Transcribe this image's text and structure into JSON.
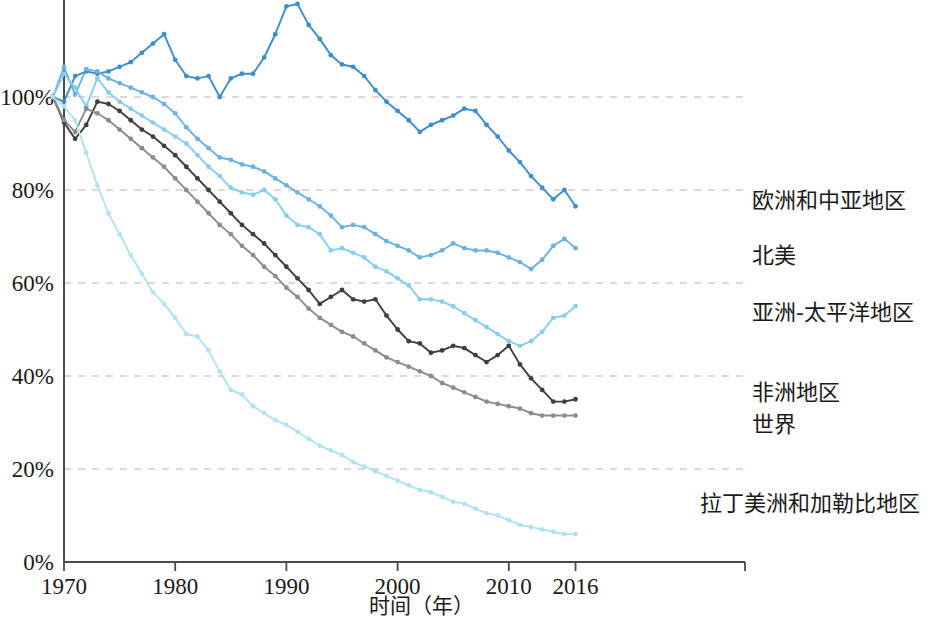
{
  "chart_data": {
    "type": "line",
    "title": "",
    "xlabel": "时间（年）",
    "ylabel": "",
    "xlim": [
      1968,
      2017
    ],
    "ylim": [
      0,
      125
    ],
    "grid": true,
    "grid_axis": "y",
    "legend_position": "right-inline-labels",
    "x_ticks": [
      1970,
      1980,
      1990,
      2000,
      2010,
      2016
    ],
    "x_tick_labels": [
      "1970",
      "1980",
      "1990",
      "2000",
      "2010",
      "2016"
    ],
    "y_ticks": [
      0,
      20,
      40,
      60,
      80,
      100
    ],
    "y_tick_labels": [
      "0%",
      "20%",
      "40%",
      "60%",
      "80%",
      "100%"
    ],
    "x": [
      1969,
      1970,
      1971,
      1972,
      1973,
      1974,
      1975,
      1976,
      1977,
      1978,
      1979,
      1980,
      1981,
      1982,
      1983,
      1984,
      1985,
      1986,
      1987,
      1988,
      1989,
      1990,
      1991,
      1992,
      1993,
      1994,
      1995,
      1996,
      1997,
      1998,
      1999,
      2000,
      2001,
      2002,
      2003,
      2004,
      2005,
      2006,
      2007,
      2008,
      2009,
      2010,
      2011,
      2012,
      2013,
      2014,
      2015,
      2016
    ],
    "series": [
      {
        "name": "欧洲和中亚地区",
        "color": "#3d8ec9",
        "marker": "circle",
        "values": [
          100.0,
          99.0,
          104.5,
          105.5,
          105.0,
          105.5,
          106.5,
          107.5,
          109.5,
          111.5,
          113.5,
          108.0,
          104.5,
          104.0,
          104.5,
          100.0,
          104.0,
          105.0,
          105.0,
          108.5,
          113.5,
          119.5,
          120.0,
          115.5,
          112.5,
          109.0,
          107.0,
          106.5,
          104.5,
          101.5,
          99.0,
          97.0,
          95.0,
          92.5,
          94.0,
          95.0,
          96.0,
          97.5,
          97.0,
          94.0,
          91.5,
          88.5,
          86.0,
          83.0,
          80.5,
          78.0,
          80.0,
          76.5
        ]
      },
      {
        "name": "北美",
        "color": "#6ab2e0",
        "marker": "circle",
        "values": [
          100.0,
          106.5,
          100.5,
          106.0,
          105.5,
          104.0,
          103.0,
          102.0,
          101.0,
          100.0,
          98.5,
          96.5,
          93.5,
          91.0,
          89.0,
          87.0,
          86.5,
          85.5,
          85.0,
          84.0,
          82.5,
          81.0,
          79.5,
          78.0,
          76.5,
          74.5,
          72.0,
          72.5,
          72.0,
          70.5,
          69.0,
          68.0,
          67.0,
          65.5,
          66.0,
          67.0,
          68.5,
          67.5,
          67.0,
          67.0,
          66.5,
          65.5,
          64.5,
          63.0,
          65.0,
          68.0,
          69.5,
          67.5
        ]
      },
      {
        "name": "亚洲-太平洋地区",
        "color": "#87ceeb",
        "marker": "circle",
        "values": [
          100.0,
          105.0,
          102.0,
          98.0,
          104.0,
          101.0,
          99.0,
          97.5,
          96.0,
          94.5,
          93.0,
          91.5,
          90.0,
          87.5,
          85.0,
          83.0,
          80.5,
          79.5,
          79.0,
          80.0,
          78.0,
          74.5,
          72.5,
          72.0,
          70.5,
          67.0,
          67.5,
          66.5,
          65.5,
          63.5,
          62.5,
          61.0,
          59.5,
          56.5,
          56.5,
          56.0,
          55.0,
          53.5,
          52.0,
          50.5,
          49.0,
          47.5,
          46.5,
          47.5,
          49.5,
          52.5,
          53.0,
          55.0
        ]
      },
      {
        "name": "非洲地区",
        "color": "#3f3f3f",
        "marker": "circle",
        "values": [
          100.0,
          94.5,
          91.0,
          94.0,
          99.0,
          98.5,
          97.0,
          95.0,
          93.0,
          91.5,
          89.5,
          87.5,
          85.0,
          82.5,
          80.0,
          77.5,
          75.0,
          72.5,
          70.5,
          68.5,
          66.0,
          63.5,
          61.0,
          58.5,
          55.5,
          57.0,
          58.5,
          56.5,
          56.0,
          56.5,
          53.0,
          50.0,
          47.5,
          47.0,
          45.0,
          45.5,
          46.5,
          46.0,
          44.5,
          43.0,
          44.5,
          46.5,
          42.5,
          39.5,
          37.0,
          34.5,
          34.5,
          35.0
        ]
      },
      {
        "name": "世界",
        "color": "#8c8c8c",
        "marker": "circle",
        "values": [
          100.0,
          95.0,
          92.5,
          97.5,
          96.5,
          95.0,
          93.0,
          91.0,
          89.0,
          87.0,
          85.0,
          82.5,
          80.0,
          77.5,
          75.0,
          72.5,
          70.5,
          68.0,
          66.0,
          63.5,
          61.5,
          59.0,
          57.0,
          54.5,
          52.5,
          51.0,
          49.5,
          48.5,
          47.0,
          45.5,
          44.0,
          43.0,
          42.0,
          41.0,
          40.0,
          38.5,
          37.5,
          36.5,
          35.5,
          34.5,
          34.0,
          33.5,
          33.0,
          32.0,
          31.5,
          31.5,
          31.5,
          31.5
        ]
      },
      {
        "name": "拉丁美洲和加勒比地区",
        "color": "#b2e2f2",
        "marker": "circle",
        "values": [
          100.0,
          98.0,
          95.0,
          88.0,
          81.0,
          75.0,
          70.5,
          66.0,
          62.0,
          58.0,
          55.5,
          52.5,
          49.0,
          48.5,
          45.5,
          41.0,
          37.0,
          36.0,
          33.5,
          32.0,
          30.5,
          29.5,
          28.0,
          26.5,
          25.0,
          24.0,
          23.0,
          21.5,
          20.5,
          19.5,
          18.5,
          17.5,
          16.5,
          15.5,
          15.0,
          14.0,
          13.0,
          12.5,
          11.5,
          10.5,
          10.0,
          9.0,
          8.0,
          7.5,
          7.0,
          6.5,
          6.0,
          6.0
        ]
      }
    ],
    "series_labels": [
      {
        "name": "欧洲和中亚地区",
        "x": 752,
        "y": 208
      },
      {
        "name": "北美",
        "x": 752,
        "y": 263
      },
      {
        "name": "亚洲-太平洋地区",
        "x": 752,
        "y": 320
      },
      {
        "name": "非洲地区",
        "x": 752,
        "y": 400
      },
      {
        "name": "世界",
        "x": 752,
        "y": 432
      },
      {
        "name": "拉丁美洲和加勒比地区",
        "x": 700,
        "y": 511
      }
    ]
  },
  "axis": {
    "x_title": "时间（年）"
  },
  "colors": {
    "europe_central_asia": "#3d8ec9",
    "north_america": "#6ab2e0",
    "asia_pacific": "#87ceeb",
    "africa": "#3f3f3f",
    "world": "#8c8c8c",
    "latin_america_caribbean": "#b2e2f2",
    "axis": "#4a4a4a",
    "grid": "#d8c8c8"
  }
}
